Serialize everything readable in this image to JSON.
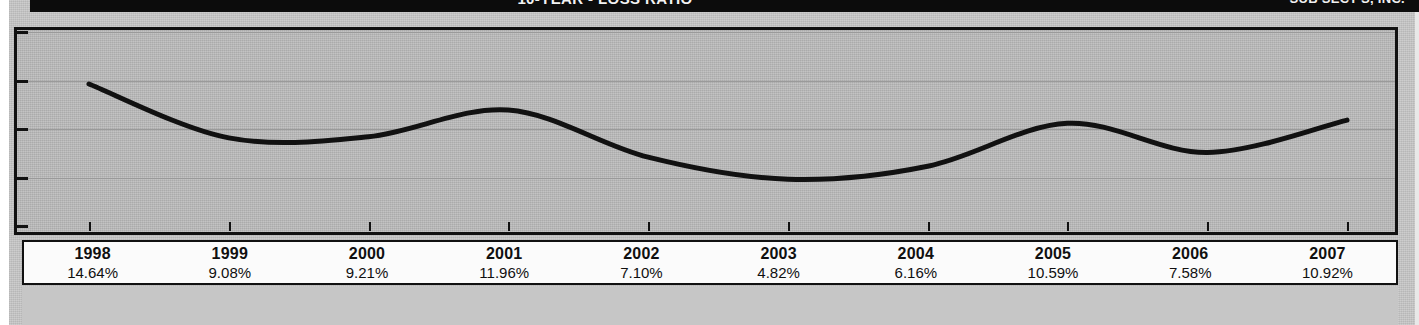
{
  "header": {
    "title": "10-YEAR - LOSS RATIO",
    "right_label": "SUB SECT'S, INC."
  },
  "chart_data": {
    "type": "line",
    "title": "10-YEAR - LOSS RATIO",
    "xlabel": "",
    "ylabel": "",
    "categories": [
      "1998",
      "1999",
      "2000",
      "2001",
      "2002",
      "2003",
      "2004",
      "2005",
      "2006",
      "2007"
    ],
    "values": [
      14.64,
      9.08,
      9.21,
      11.96,
      7.1,
      4.82,
      6.16,
      10.59,
      7.58,
      10.92
    ],
    "value_labels": [
      "14.64%",
      "9.08%",
      "9.21%",
      "11.96%",
      "7.10%",
      "4.82%",
      "6.16%",
      "10.59%",
      "7.58%",
      "10.92%"
    ],
    "ylim": [
      0,
      20
    ],
    "y_gridlines": [
      5,
      10,
      15,
      20
    ],
    "grid": true,
    "legend": "none",
    "series": [
      {
        "name": "Loss Ratio",
        "values": [
          14.64,
          9.08,
          9.21,
          11.96,
          7.1,
          4.82,
          6.16,
          10.59,
          7.58,
          10.92
        ],
        "color": "#111111",
        "smooth": true
      }
    ]
  },
  "axis": {
    "y_tick_count": 5,
    "x_tick_count": 10
  },
  "colors": {
    "header_background": "#0c0c0c",
    "header_text": "#f2f2f2",
    "plot_background": "#bdbdbd",
    "plot_border": "#111111",
    "line": "#111111",
    "grid": "#9a9a9a",
    "table_background": "#fbfbfb",
    "paper": "#c9c9c9"
  },
  "table": {
    "rows": [
      {
        "year": "1998",
        "value": "14.64%"
      },
      {
        "year": "1999",
        "value": "9.08%"
      },
      {
        "year": "2000",
        "value": "9.21%"
      },
      {
        "year": "2001",
        "value": "11.96%"
      },
      {
        "year": "2002",
        "value": "7.10%"
      },
      {
        "year": "2003",
        "value": "4.82%"
      },
      {
        "year": "2004",
        "value": "6.16%"
      },
      {
        "year": "2005",
        "value": "10.59%"
      },
      {
        "year": "2006",
        "value": "7.58%"
      },
      {
        "year": "2007",
        "value": "10.92%"
      }
    ]
  }
}
